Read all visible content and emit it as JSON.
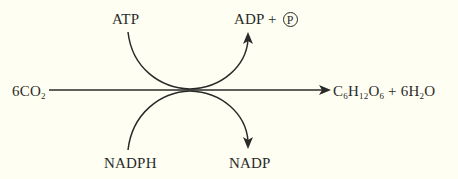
{
  "diagram": {
    "title": "",
    "type": "reaction-scheme",
    "reactant": {
      "coefficient": "6",
      "formula_main": "CO",
      "formula_sub": "2"
    },
    "product": {
      "c": "C",
      "c_sub": "6",
      "h": "H",
      "h_sub": "12",
      "o": "O",
      "o_sub": "6",
      "plus": " + ",
      "water_coef": "6H",
      "water_sub": "2",
      "water_o": "O"
    },
    "top_input": "ATP",
    "top_output": {
      "text": "ADP + ",
      "circled": "P"
    },
    "bottom_input": "NADPH",
    "bottom_output": "NADP",
    "colors": {
      "background": "#fefff2",
      "ink": "#2a2a2a"
    }
  }
}
